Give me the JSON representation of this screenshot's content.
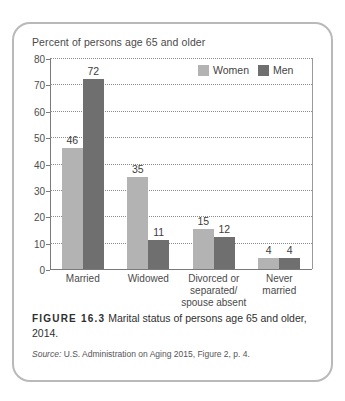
{
  "figure": {
    "label": "FIGURE 16.3",
    "caption": "Marital status of persons age 65 and older, 2014.",
    "source_word": "Source:",
    "source_text": "U.S. Administration on Aging 2015, Figure 2, p. 4."
  },
  "colors": {
    "women": "#b3b3b3",
    "men": "#6f6f6f",
    "card_border": "#b9b9b9",
    "axis": "#7a7a7a"
  },
  "chart_data": {
    "type": "bar",
    "title": "Percent of persons age 65 and older",
    "xlabel": "",
    "ylabel": "Percent of persons age 65 and older",
    "categories": [
      "Married",
      "Widowed",
      "Divorced or\nseparated/\nspouse absent",
      "Never\nmarried"
    ],
    "series": [
      {
        "name": "Women",
        "values": [
          46,
          35,
          15,
          4
        ]
      },
      {
        "name": "Men",
        "values": [
          72,
          11,
          12,
          4
        ]
      }
    ],
    "ylim": [
      0,
      80
    ],
    "yticks": [
      0,
      10,
      20,
      30,
      40,
      50,
      60,
      70,
      80
    ],
    "ytick_labels": [
      "0",
      "10",
      "20",
      "30",
      "40",
      "50",
      "60",
      "70",
      "80"
    ],
    "grid": true,
    "legend": [
      "Women",
      "Men"
    ],
    "legend_position": "top-right"
  }
}
